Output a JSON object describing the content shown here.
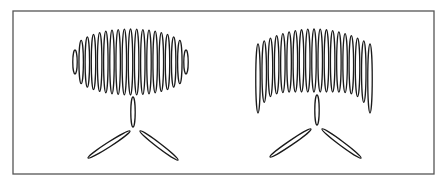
{
  "figure": {
    "frame": {
      "x": 13,
      "y": 11,
      "width": 421,
      "height": 163,
      "stroke": "#555555"
    },
    "stroke_color": "#1a1a1a",
    "panels": [
      {
        "name": "left",
        "head_shape": "oval",
        "loop_count": 19,
        "head": {
          "x_min": 75,
          "x_max": 186,
          "y_center": 62,
          "half_height_center": 33,
          "half_height_edge": 12,
          "top_curve": 0
        },
        "stem": {
          "cx": 133,
          "y1": 97,
          "y2": 127,
          "rx": 2.2
        },
        "legs": [
          {
            "x1": 130,
            "y1": 131,
            "x2": 88,
            "y2": 158
          },
          {
            "x1": 140,
            "y1": 131,
            "x2": 178,
            "y2": 160
          }
        ]
      },
      {
        "name": "right",
        "head_shape": "arch",
        "loop_count": 19,
        "head": {
          "x_min": 258,
          "x_max": 370,
          "y_top_center": 29,
          "y_top_edge": 44,
          "y_bottom_center": 92,
          "y_bottom_edge": 113
        },
        "stem": {
          "cx": 317,
          "y1": 95,
          "y2": 125,
          "rx": 2.2
        },
        "legs": [
          {
            "x1": 311,
            "y1": 129,
            "x2": 270,
            "y2": 157
          },
          {
            "x1": 322,
            "y1": 129,
            "x2": 361,
            "y2": 158
          }
        ]
      }
    ]
  }
}
